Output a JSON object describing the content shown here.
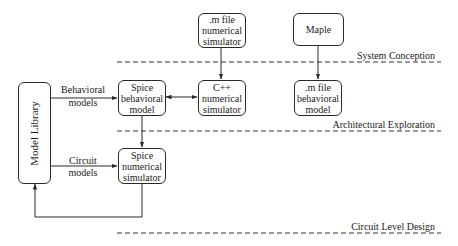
{
  "diagram": {
    "nodes": {
      "model_library": {
        "label": "Model Library"
      },
      "m_file_numerical": {
        "lines": [
          ".m file",
          "numerical",
          "simulator"
        ]
      },
      "maple": {
        "label": "Maple"
      },
      "spice_behavioral": {
        "lines": [
          "Spice",
          "behavioral",
          "model"
        ]
      },
      "cpp_numerical": {
        "lines": [
          "C++",
          "numerical",
          "simulator"
        ]
      },
      "m_file_behavioral": {
        "lines": [
          ".m file",
          "behavioral",
          "model"
        ]
      },
      "spice_numerical": {
        "lines": [
          "Spice",
          "numerical",
          "simulator"
        ]
      }
    },
    "edge_labels": {
      "behavioral_models": [
        "Behavioral",
        "models"
      ],
      "circuit_models": [
        "Circuit",
        "models"
      ]
    },
    "phases": [
      {
        "label": "System Conception"
      },
      {
        "label": "Architectural Exploration"
      },
      {
        "label": "Circuit Level Design"
      }
    ],
    "edges": [
      {
        "from": "model_library",
        "to": "spice_behavioral",
        "label": "Behavioral models"
      },
      {
        "from": "spice_behavioral",
        "to": "cpp_numerical",
        "bidirectional": true
      },
      {
        "from": "m_file_numerical",
        "to": "cpp_numerical"
      },
      {
        "from": "maple",
        "to": "m_file_behavioral"
      },
      {
        "from": "spice_behavioral",
        "to": "spice_numerical"
      },
      {
        "from": "model_library",
        "to": "spice_numerical",
        "label": "Circuit models"
      },
      {
        "from": "spice_numerical",
        "to": "model_library"
      }
    ],
    "colors": {
      "line": "#2a2a2a",
      "background": "#ffffff"
    }
  }
}
